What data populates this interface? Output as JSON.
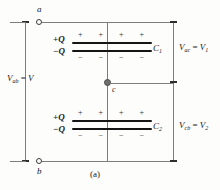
{
  "figure": {
    "caption": "(a)",
    "terminals": {
      "top": "a",
      "bottom": "b",
      "middle": "c"
    },
    "labels": {
      "source_voltage": "V",
      "source_voltage_sub": "ab",
      "source_equals": "=",
      "v_ac_sub": "ac",
      "v_ac_value": "V",
      "v_ac_value_sub": "1",
      "v_cb_sub": "cb",
      "v_cb_value": "V",
      "v_cb_value_sub": "2",
      "v_symbol": "V"
    },
    "capacitors": [
      {
        "name": "C",
        "subscript": "1",
        "charge_positive": "+Q",
        "charge_negative": "−Q",
        "plus_signs": "+  +      +  +",
        "minus_signs": "−  −      −  −"
      },
      {
        "name": "C",
        "subscript": "2",
        "charge_positive": "+Q",
        "charge_negative": "−Q",
        "plus_signs": "+  +      +  +",
        "minus_signs": "−  −      −  −"
      }
    ],
    "colors": {
      "wire": "#7d7d7d",
      "plate": "#151515",
      "node": "#6e6e6e",
      "text": "#1a1a1a",
      "background": "#fdfdfc"
    }
  }
}
